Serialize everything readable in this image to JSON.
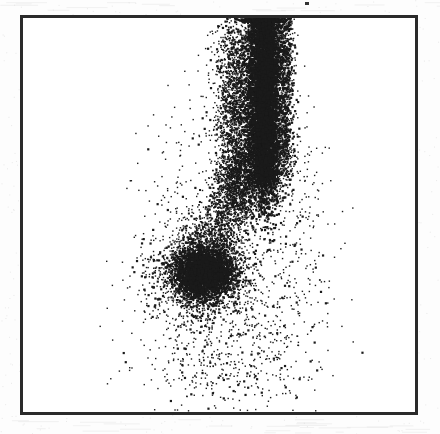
{
  "figure": {
    "kind": "scatter-dot-plot",
    "width": 440,
    "height": 434,
    "background_color": "#fdfdfd",
    "plot_background_color": "#ffffff",
    "dot_color": "#1a1a1a",
    "frame": {
      "color": "#2a2a2a",
      "thickness_px": 3,
      "left": 20,
      "top": 15,
      "right": 418,
      "bottom": 415
    },
    "artifacts": [
      {
        "name": "top-margin-speck",
        "x": 305,
        "y": 2,
        "w": 4,
        "h": 3
      }
    ]
  },
  "chart_data": {
    "type": "scatter",
    "title": "",
    "subtitle": "",
    "xlabel": "",
    "ylabel": "",
    "xlim": [
      0,
      1
    ],
    "ylim": [
      0,
      1
    ],
    "grid": false,
    "legend": false,
    "xticks": [],
    "yticks": [],
    "xticklabels": [],
    "yticklabels": [],
    "axis_frame": "box",
    "marker": "point",
    "marker_size_px": 1.6,
    "marker_color": "#1a1a1a",
    "total_points": 14200,
    "clipped_at_top": true,
    "populations": [
      {
        "name": "upper-column-population",
        "shape": "vertical-band",
        "n_points": 6200,
        "center_px": [
          263,
          95
        ],
        "center_axes": [
          0.611,
          0.8
        ],
        "spread_x_px": 16,
        "spread_y_px": 95,
        "density": "saturated",
        "clipped": "top"
      },
      {
        "name": "column-left-halo",
        "shape": "vertical-band",
        "n_points": 2300,
        "center_px": [
          236,
          120
        ],
        "center_axes": [
          0.543,
          0.738
        ],
        "spread_x_px": 20,
        "spread_y_px": 85,
        "density": "medium"
      },
      {
        "name": "column-right-edge",
        "shape": "vertical-band",
        "n_points": 900,
        "center_px": [
          285,
          90
        ],
        "center_axes": [
          0.666,
          0.812
        ],
        "spread_x_px": 8,
        "spread_y_px": 80,
        "density": "medium"
      },
      {
        "name": "lower-left-cluster",
        "shape": "oval",
        "n_points": 2600,
        "center_px": [
          202,
          271
        ],
        "center_axes": [
          0.458,
          0.36
        ],
        "spread_x_px": 24,
        "spread_y_px": 22,
        "density": "high"
      },
      {
        "name": "cluster-halo",
        "shape": "oval",
        "n_points": 1500,
        "center_px": [
          205,
          272
        ],
        "center_axes": [
          0.465,
          0.358
        ],
        "spread_x_px": 46,
        "spread_y_px": 40,
        "density": "medium"
      },
      {
        "name": "connecting-bridge",
        "shape": "diagonal-band",
        "n_points": 1300,
        "start_px": [
          248,
          150
        ],
        "end_px": [
          210,
          250
        ],
        "spread_px": 26,
        "density": "medium"
      },
      {
        "name": "lower-debris",
        "shape": "diffuse",
        "n_points": 620,
        "center_px": [
          225,
          345
        ],
        "center_axes": [
          0.515,
          0.175
        ],
        "spread_x_px": 58,
        "spread_y_px": 45,
        "density": "sparse"
      },
      {
        "name": "left-sparse-scatter",
        "shape": "diffuse",
        "n_points": 220,
        "center_px": [
          178,
          215
        ],
        "center_axes": [
          0.397,
          0.5
        ],
        "spread_x_px": 34,
        "spread_y_px": 70,
        "density": "very-sparse"
      },
      {
        "name": "right-sparse-scatter",
        "shape": "diffuse",
        "n_points": 260,
        "center_px": [
          296,
          230
        ],
        "center_axes": [
          0.693,
          0.463
        ],
        "spread_x_px": 26,
        "spread_y_px": 80,
        "density": "very-sparse"
      }
    ]
  }
}
